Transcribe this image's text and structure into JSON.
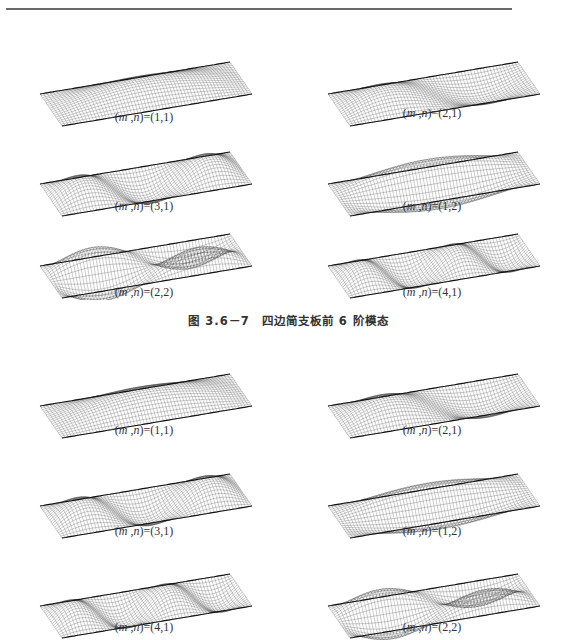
{
  "figure_top": {
    "caption": "图 3.6－7　四边简支板前 6 阶模态",
    "panels": [
      {
        "label": "(m,n)=(1,1)",
        "m": 1,
        "n": 1
      },
      {
        "label": "(m,n)=(2,1)",
        "m": 2,
        "n": 1
      },
      {
        "label": "(m,n)=(3,1)",
        "m": 3,
        "n": 1
      },
      {
        "label": "(m,n)=(1,2)",
        "m": 1,
        "n": 2
      },
      {
        "label": "(m,n)=(2,2)",
        "m": 2,
        "n": 2
      },
      {
        "label": "(m,n)=(4,1)",
        "m": 4,
        "n": 1
      }
    ]
  },
  "figure_bottom": {
    "panels": [
      {
        "label": "(m,n)=(1,1)",
        "m": 1,
        "n": 1
      },
      {
        "label": "(m,n)=(2,1)",
        "m": 2,
        "n": 1
      },
      {
        "label": "(m,n)=(3,1)",
        "m": 3,
        "n": 1
      },
      {
        "label": "(m,n)=(1,2)",
        "m": 1,
        "n": 2
      },
      {
        "label": "(m,n)=(4,1)",
        "m": 4,
        "n": 1
      },
      {
        "label": "(m,n)=(2,2)",
        "m": 2,
        "n": 2
      }
    ]
  },
  "colors": {
    "mesh": "#3a3a3a",
    "rule": "#6a6a6a",
    "background": "#ffffff"
  }
}
